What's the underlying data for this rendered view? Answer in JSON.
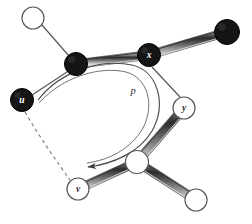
{
  "figure": {
    "type": "graph-diagram",
    "width": 252,
    "height": 224,
    "background": "#ffffff"
  },
  "colors": {
    "black_node_fill": "#151515",
    "black_node_stroke": "#000000",
    "white_node_fill": "#ffffff",
    "white_node_stroke": "#555555",
    "thin_edge": "#555555",
    "thick_edge_dark": "#2b2b2b",
    "thick_edge_light": "#b5b5b5",
    "thick_edge_outline": "#777777",
    "arc": "#4a4a4a",
    "dashed_edge": "#777777",
    "label_light": "#ffffff",
    "label_dark": "#2a2a2a"
  },
  "nodes": [
    {
      "id": "n_topleft",
      "label": "",
      "fill": "white",
      "cx": 33,
      "cy": 18,
      "r": 11
    },
    {
      "id": "n_black1",
      "label": "",
      "fill": "black",
      "cx": 76,
      "cy": 64,
      "r": 11.5
    },
    {
      "id": "n_x",
      "label": "x",
      "fill": "black",
      "cx": 149,
      "cy": 55,
      "r": 11.5
    },
    {
      "id": "n_topright",
      "label": "",
      "fill": "black",
      "cx": 227,
      "cy": 32,
      "r": 12.5
    },
    {
      "id": "n_u",
      "label": "u",
      "fill": "black",
      "cx": 22,
      "cy": 100,
      "r": 11.5
    },
    {
      "id": "n_y",
      "label": "y",
      "fill": "white",
      "cx": 184,
      "cy": 108,
      "r": 11
    },
    {
      "id": "n_center",
      "label": "",
      "fill": "white",
      "cx": 137,
      "cy": 162,
      "r": 11.5
    },
    {
      "id": "n_v",
      "label": "v",
      "fill": "white",
      "cx": 78,
      "cy": 189,
      "r": 11
    },
    {
      "id": "n_botright",
      "label": "",
      "fill": "white",
      "cx": 196,
      "cy": 200,
      "r": 11
    }
  ],
  "edges_thick": [
    {
      "id": "e_black1_x",
      "from": "n_black1",
      "to": "n_x",
      "style": "matched"
    },
    {
      "id": "e_x_topright",
      "from": "n_x",
      "to": "n_topright",
      "style": "matched"
    },
    {
      "id": "e_y_center",
      "from": "n_y",
      "to": "n_center",
      "style": "matched"
    },
    {
      "id": "e_center_v",
      "from": "n_center",
      "to": "n_v",
      "style": "matched"
    },
    {
      "id": "e_center_botright",
      "from": "n_center",
      "to": "n_botright",
      "style": "matched"
    }
  ],
  "edges_thin": [
    {
      "id": "e_topleft_black1",
      "from": "n_topleft",
      "to": "n_black1",
      "style": "unmatched"
    },
    {
      "id": "e_black1_u",
      "from": "n_black1",
      "to": "n_u",
      "style": "unmatched"
    },
    {
      "id": "e_x_y",
      "from": "n_x",
      "to": "n_y",
      "style": "unmatched"
    }
  ],
  "edges_dashed": [
    {
      "id": "e_u_v",
      "from": "n_u",
      "to": "n_v",
      "style": "dashed"
    }
  ],
  "arc": {
    "id": "path-p",
    "label": "p",
    "label_x": 133,
    "label_y": 92,
    "start_x": 38,
    "start_y": 100,
    "end_x": 84,
    "end_y": 168,
    "has_arrowhead": true,
    "arrow_direction": "down-left"
  },
  "labels": {
    "u": "u",
    "v": "v",
    "x": "x",
    "y": "y",
    "p": "p"
  }
}
